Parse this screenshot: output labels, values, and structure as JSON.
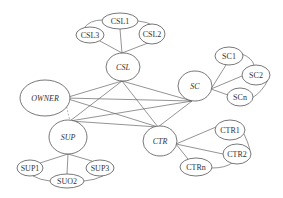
{
  "diagram": {
    "type": "network",
    "hubs": [
      {
        "id": "CSL",
        "label": "CSL",
        "cx": 123,
        "cy": 67,
        "rx": 17,
        "ry": 14
      },
      {
        "id": "SC",
        "label": "SC",
        "cx": 195,
        "cy": 86,
        "rx": 17,
        "ry": 15
      },
      {
        "id": "OWNER",
        "label": "OWNER",
        "cx": 45,
        "cy": 98,
        "rx": 25,
        "ry": 18
      },
      {
        "id": "SUP",
        "label": "SUP",
        "cx": 68,
        "cy": 137,
        "rx": 19,
        "ry": 17
      },
      {
        "id": "CTR",
        "label": "CTR",
        "cx": 160,
        "cy": 141,
        "rx": 17,
        "ry": 15
      }
    ],
    "leaves": [
      {
        "id": "CSL1",
        "label": "CSL1",
        "cx": 120,
        "cy": 21,
        "rx": 18,
        "ry": 8
      },
      {
        "id": "CSL2",
        "label": "CSL2",
        "cx": 152,
        "cy": 34,
        "rx": 13,
        "ry": 10
      },
      {
        "id": "CSL3",
        "label": "CSL3",
        "cx": 90,
        "cy": 35,
        "rx": 14,
        "ry": 8
      },
      {
        "id": "SC1",
        "label": "SC1",
        "cx": 229,
        "cy": 56,
        "rx": 14,
        "ry": 9
      },
      {
        "id": "SC2",
        "label": "SC2",
        "cx": 256,
        "cy": 75,
        "rx": 14,
        "ry": 10
      },
      {
        "id": "SCn",
        "label": "SCn",
        "cx": 240,
        "cy": 97,
        "rx": 13,
        "ry": 9
      },
      {
        "id": "CTR1",
        "label": "CTR1",
        "cx": 230,
        "cy": 130,
        "rx": 15,
        "ry": 10
      },
      {
        "id": "CTR2",
        "label": "CTR2",
        "cx": 237,
        "cy": 154,
        "rx": 14,
        "ry": 10
      },
      {
        "id": "CTRn",
        "label": "CTRn",
        "cx": 196,
        "cy": 167,
        "rx": 16,
        "ry": 9
      },
      {
        "id": "SUP1",
        "label": "SUP1",
        "cx": 30,
        "cy": 168,
        "rx": 13,
        "ry": 8
      },
      {
        "id": "SUP3",
        "label": "SUP3",
        "cx": 100,
        "cy": 168,
        "rx": 14,
        "ry": 8
      },
      {
        "id": "SUO2",
        "label": "SUO2",
        "cx": 67,
        "cy": 181,
        "rx": 17,
        "ry": 7
      }
    ],
    "edges": [
      {
        "from": "OWNER",
        "to": "CSL",
        "x1": 65,
        "y1": 98,
        "x2": 122,
        "y2": 81
      },
      {
        "from": "OWNER",
        "to": "SC",
        "x1": 65,
        "y1": 98,
        "x2": 192,
        "y2": 101
      },
      {
        "from": "OWNER",
        "to": "CTR",
        "x1": 65,
        "y1": 98,
        "x2": 158,
        "y2": 127
      },
      {
        "from": "OWNER",
        "to": "SUP",
        "x1": 65,
        "y1": 100,
        "x2": 70,
        "y2": 121,
        "dashed": true
      },
      {
        "from": "CSL",
        "to": "SC",
        "x1": 122,
        "y1": 81,
        "x2": 192,
        "y2": 101
      },
      {
        "from": "CSL",
        "to": "SUP",
        "x1": 122,
        "y1": 81,
        "x2": 70,
        "y2": 121
      },
      {
        "from": "CSL",
        "to": "CTR",
        "x1": 122,
        "y1": 81,
        "x2": 158,
        "y2": 127
      },
      {
        "from": "SC",
        "to": "SUP",
        "x1": 192,
        "y1": 101,
        "x2": 70,
        "y2": 121
      },
      {
        "from": "SC",
        "to": "CTR",
        "x1": 192,
        "y1": 101,
        "x2": 158,
        "y2": 127
      },
      {
        "from": "SUP",
        "to": "CTR",
        "x1": 70,
        "y1": 121,
        "x2": 158,
        "y2": 127
      },
      {
        "from": "CSL",
        "to": "CSL1",
        "x1": 122,
        "y1": 53,
        "x2": 120,
        "y2": 29
      },
      {
        "from": "CSL",
        "to": "CSL2",
        "x1": 122,
        "y1": 53,
        "x2": 148,
        "y2": 43
      },
      {
        "from": "CSL",
        "to": "CSL3",
        "x1": 122,
        "y1": 53,
        "x2": 100,
        "y2": 41
      },
      {
        "from": "CSL3",
        "to": "CSL1",
        "path": "M 84 28 Q 90 20 102 20"
      },
      {
        "from": "CSL1",
        "to": "CSL2",
        "path": "M 138 21 Q 148 22 152 25"
      },
      {
        "from": "SC",
        "to": "SC1",
        "x1": 211,
        "y1": 89,
        "x2": 226,
        "y2": 65
      },
      {
        "from": "SC",
        "to": "SC2",
        "x1": 211,
        "y1": 89,
        "x2": 242,
        "y2": 76
      },
      {
        "from": "SC",
        "to": "SCn",
        "x1": 211,
        "y1": 89,
        "x2": 228,
        "y2": 95
      },
      {
        "from": "SC1",
        "to": "SC2",
        "path": "M 242 54 Q 252 58 254 65"
      },
      {
        "from": "SC2",
        "to": "SCn",
        "path": "M 268 80 Q 262 92 252 98"
      },
      {
        "from": "CTR",
        "to": "CTR1",
        "x1": 176,
        "y1": 144,
        "x2": 216,
        "y2": 127
      },
      {
        "from": "CTR",
        "to": "CTR2",
        "x1": 176,
        "y1": 144,
        "x2": 223,
        "y2": 154
      },
      {
        "from": "CTR",
        "to": "CTRn",
        "x1": 176,
        "y1": 144,
        "x2": 188,
        "y2": 159
      },
      {
        "from": "CTR1",
        "to": "CTR2",
        "path": "M 244 134 Q 248 142 250 150"
      },
      {
        "from": "CTR2",
        "to": "CTRn",
        "path": "M 232 163 Q 225 168 212 168"
      },
      {
        "from": "SUP",
        "to": "SUP1",
        "x1": 68,
        "y1": 154,
        "x2": 40,
        "y2": 163
      },
      {
        "from": "SUP",
        "to": "SUO2",
        "x1": 68,
        "y1": 154,
        "x2": 67,
        "y2": 174
      },
      {
        "from": "SUP",
        "to": "SUP3",
        "x1": 68,
        "y1": 154,
        "x2": 92,
        "y2": 161
      },
      {
        "from": "SUP1",
        "to": "SUO2",
        "path": "M 33 176 Q 40 180 50 181"
      },
      {
        "from": "SUP3",
        "to": "SUO2",
        "path": "M 103 176 Q 95 180 84 181"
      }
    ]
  }
}
